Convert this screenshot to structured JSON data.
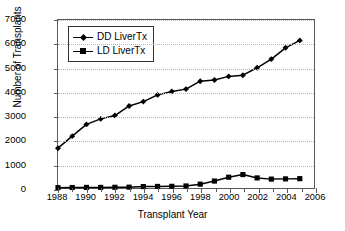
{
  "chart_data": {
    "type": "line",
    "title": "",
    "xlabel": "Transplant Year",
    "ylabel": "Number of Transplants",
    "xlim": [
      1988,
      2006
    ],
    "ylim": [
      0,
      7000
    ],
    "grid": "horizontal dotted gridlines at every 1000",
    "legend_position": "top-left inside plot area",
    "x": [
      1988,
      1989,
      1990,
      1991,
      1992,
      1993,
      1994,
      1995,
      1996,
      1997,
      1998,
      1999,
      2000,
      2001,
      2002,
      2003,
      2004,
      2005
    ],
    "xticks": [
      1988,
      1990,
      1992,
      1994,
      1996,
      1998,
      2000,
      2002,
      2004,
      2006
    ],
    "xtick_labels": [
      "1988",
      "1990",
      "1992",
      "1994",
      "1996",
      "1998",
      "2000",
      "2002",
      "2004",
      "2006"
    ],
    "yticks": [
      0,
      1000,
      2000,
      3000,
      4000,
      5000,
      6000,
      7000
    ],
    "ytick_labels": [
      "0",
      "1000",
      "2000",
      "3000",
      "4000",
      "5000",
      "6000",
      "7000"
    ],
    "series": [
      {
        "name": "DD LiverTx",
        "marker": "diamond",
        "color": "#000000",
        "values": [
          1660,
          2160,
          2650,
          2880,
          3020,
          3420,
          3600,
          3880,
          4020,
          4120,
          4450,
          4500,
          4650,
          4700,
          5010,
          5370,
          5840,
          6150
        ]
      },
      {
        "name": "LD LiverTx",
        "marker": "square",
        "color": "#000000",
        "values": [
          15,
          20,
          25,
          25,
          30,
          35,
          60,
          65,
          70,
          85,
          160,
          290,
          450,
          560,
          420,
          370,
          380,
          390
        ]
      }
    ]
  },
  "legend": {
    "entries": [
      {
        "label": "DD LiverTx"
      },
      {
        "label": "LD LiverTx"
      }
    ]
  },
  "axes": {
    "y_title": "Number of Transplants",
    "x_title": "Transplant Year"
  }
}
